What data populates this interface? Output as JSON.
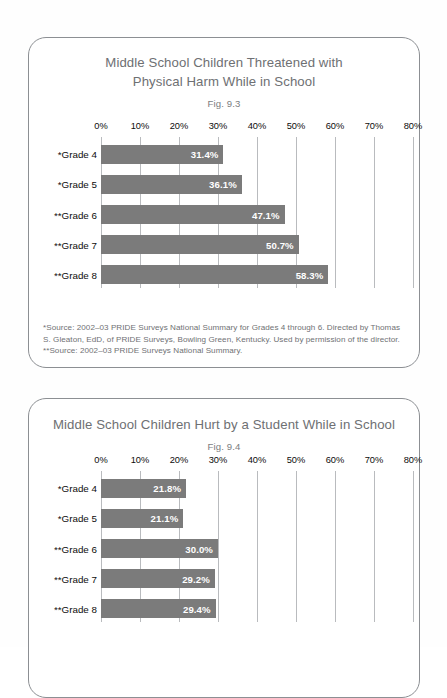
{
  "page": {
    "background": "#fefefe",
    "bar_color": "#7b7b7b",
    "gridline_color": "#b9bbbe",
    "title_color": "#6e7073",
    "card_border_color": "#8c8f93"
  },
  "charts": [
    {
      "title_line1": "Middle School Children Threatened with",
      "title_line2": "Physical Harm While in School",
      "fig": "Fig. 9.3",
      "footnote_lines": [
        "*Source: 2002–03 PRIDE Surveys National Summary for Grades 4 through 6. Directed by Thomas S. Gleaton, EdD, of PRIDE Surveys, Bowling Green, Kentucky. Used by permission of the director.",
        "**Source: 2002–03 PRIDE Surveys National Summary."
      ],
      "chart_data": {
        "type": "bar",
        "orientation": "horizontal",
        "title": "Middle School Children Threatened with Physical Harm While in School",
        "subtitle": "Fig. 9.3",
        "xlabel": "",
        "ylabel": "",
        "xlim": [
          0,
          80
        ],
        "grid": true,
        "legend": "none",
        "tick_labels": [
          "0%",
          "10%",
          "20%",
          "30%",
          "40%",
          "50%",
          "60%",
          "70%",
          "80%"
        ],
        "ticks": [
          0,
          10,
          20,
          30,
          40,
          50,
          60,
          70,
          80
        ],
        "categories": [
          "*Grade 4",
          "*Grade 5",
          "**Grade 6",
          "**Grade 7",
          "**Grade 8"
        ],
        "values": [
          31.4,
          36.1,
          47.1,
          50.7,
          58.3
        ],
        "data_labels": [
          "31.4%",
          "36.1%",
          "47.1%",
          "50.7%",
          "58.3%"
        ]
      }
    },
    {
      "title_line1": "Middle School Children Hurt by a Student While in School",
      "title_line2": "",
      "fig": "Fig. 9.4",
      "footnote_lines": [],
      "chart_data": {
        "type": "bar",
        "orientation": "horizontal",
        "title": "Middle School Children Hurt by a Student While in School",
        "subtitle": "Fig. 9.4",
        "xlabel": "",
        "ylabel": "",
        "xlim": [
          0,
          80
        ],
        "grid": true,
        "legend": "none",
        "tick_labels": [
          "0%",
          "10%",
          "20%",
          "30%",
          "40%",
          "50%",
          "60%",
          "70%",
          "80%"
        ],
        "ticks": [
          0,
          10,
          20,
          30,
          40,
          50,
          60,
          70,
          80
        ],
        "categories": [
          "*Grade 4",
          "*Grade 5",
          "**Grade 6",
          "**Grade 7",
          "**Grade 8"
        ],
        "values": [
          21.8,
          21.1,
          30.0,
          29.2,
          29.4
        ],
        "data_labels": [
          "21.8%",
          "21.1%",
          "30.0%",
          "29.2%",
          "29.4%"
        ]
      }
    }
  ]
}
